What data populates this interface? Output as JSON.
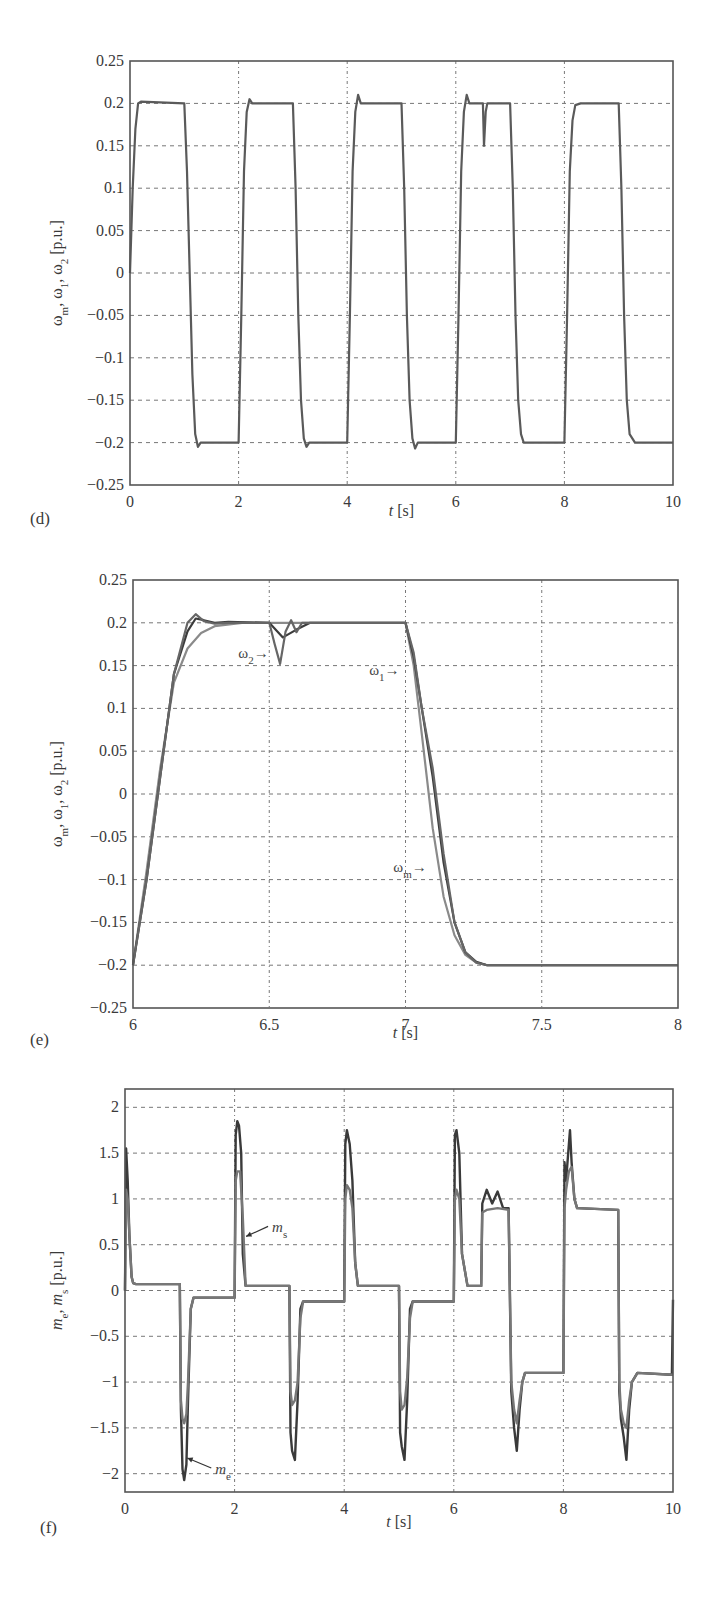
{
  "chart_data": [
    {
      "id": "d",
      "type": "line",
      "panel_label": "(d)",
      "title": "",
      "xlabel": "t [s]",
      "ylabel": "ωm, ω1, ω2 [p.u.]",
      "xlim": [
        0,
        10
      ],
      "ylim": [
        -0.25,
        0.25
      ],
      "xticks": [
        0,
        2,
        4,
        6,
        8,
        10
      ],
      "xtick_labels": [
        "0",
        "2",
        "4",
        "6",
        "8",
        "10"
      ],
      "yticks": [
        0.25,
        0.2,
        0.15,
        0.1,
        0.05,
        0,
        -0.05,
        -0.1,
        -0.15,
        -0.2,
        -0.25
      ],
      "ytick_labels": [
        "0.25",
        "0.2",
        "0.15",
        "0.1",
        "0.05",
        "0",
        "−0.05",
        "−0.1",
        "−0.15",
        "−0.2",
        "−0.25"
      ],
      "grid": true,
      "series": [
        {
          "name": "ωm, ω1, ω2 (overlapping)",
          "color": "#5a5a5a",
          "x": [
            0,
            0.05,
            0.1,
            0.15,
            0.2,
            1.0,
            1.05,
            1.1,
            1.15,
            1.2,
            1.25,
            1.3,
            2.0,
            2.05,
            2.1,
            2.15,
            2.2,
            2.25,
            3.0,
            3.05,
            3.1,
            3.15,
            3.2,
            3.25,
            3.3,
            4.0,
            4.05,
            4.1,
            4.15,
            4.2,
            4.25,
            5.0,
            5.05,
            5.1,
            5.15,
            5.2,
            5.25,
            5.3,
            6.0,
            6.05,
            6.1,
            6.15,
            6.2,
            6.25,
            6.5,
            6.52,
            6.55,
            6.58,
            6.6,
            7.0,
            7.05,
            7.1,
            7.15,
            7.2,
            7.25,
            7.35,
            8.0,
            8.05,
            8.1,
            8.15,
            8.2,
            8.3,
            9.0,
            9.05,
            9.1,
            9.15,
            9.2,
            9.3,
            10.0
          ],
          "y": [
            0.0,
            0.1,
            0.17,
            0.2,
            0.202,
            0.2,
            0.12,
            0.0,
            -0.12,
            -0.19,
            -0.205,
            -0.2,
            -0.2,
            -0.05,
            0.12,
            0.19,
            0.205,
            0.2,
            0.2,
            0.1,
            -0.05,
            -0.15,
            -0.195,
            -0.205,
            -0.2,
            -0.2,
            -0.05,
            0.12,
            0.19,
            0.21,
            0.2,
            0.2,
            0.1,
            -0.05,
            -0.15,
            -0.195,
            -0.207,
            -0.2,
            -0.2,
            -0.05,
            0.12,
            0.19,
            0.21,
            0.2,
            0.2,
            0.15,
            0.19,
            0.2,
            0.2,
            0.2,
            0.1,
            -0.05,
            -0.15,
            -0.19,
            -0.2,
            -0.2,
            -0.2,
            -0.05,
            0.12,
            0.18,
            0.198,
            0.2,
            0.2,
            0.1,
            -0.05,
            -0.15,
            -0.19,
            -0.2,
            -0.2
          ]
        }
      ]
    },
    {
      "id": "e",
      "type": "line",
      "panel_label": "(e)",
      "title": "",
      "xlabel": "t [s]",
      "ylabel": "ωm, ω1, ω2 [p.u.]",
      "xlim": [
        6,
        8
      ],
      "ylim": [
        -0.25,
        0.25
      ],
      "xticks": [
        6,
        6.5,
        7,
        7.5,
        8
      ],
      "xtick_labels": [
        "6",
        "6.5",
        "7",
        "7.5",
        "8"
      ],
      "yticks": [
        0.25,
        0.2,
        0.15,
        0.1,
        0.05,
        0,
        -0.05,
        -0.1,
        -0.15,
        -0.2,
        -0.25
      ],
      "ytick_labels": [
        "0.25",
        "0.2",
        "0.15",
        "0.1",
        "0.05",
        "0",
        "−0.05",
        "−0.1",
        "−0.15",
        "−0.2",
        "−0.25"
      ],
      "grid": true,
      "annotations": [
        {
          "text": "ω2→",
          "target": "ω2",
          "x": 6.52,
          "y": 0.165
        },
        {
          "text": "ω1→",
          "target": "ω1",
          "x": 7.0,
          "y": 0.145
        },
        {
          "text": "ωm→",
          "target": "ωm",
          "x": 7.1,
          "y": -0.085
        }
      ],
      "series": [
        {
          "name": "ωm",
          "color": "#8a8a8a",
          "x": [
            6.0,
            6.05,
            6.1,
            6.15,
            6.2,
            6.25,
            6.3,
            6.4,
            6.5,
            7.0,
            7.03,
            7.06,
            7.1,
            7.14,
            7.18,
            7.22,
            7.26,
            7.3,
            7.4,
            8.0
          ],
          "y": [
            -0.2,
            -0.09,
            0.03,
            0.13,
            0.17,
            0.188,
            0.196,
            0.2,
            0.2,
            0.2,
            0.15,
            0.07,
            -0.04,
            -0.12,
            -0.165,
            -0.188,
            -0.197,
            -0.2,
            -0.2,
            -0.2
          ]
        },
        {
          "name": "ω1",
          "color": "#3c3c3c",
          "x": [
            6.0,
            6.05,
            6.1,
            6.15,
            6.2,
            6.23,
            6.26,
            6.3,
            6.35,
            6.5,
            6.55,
            6.6,
            6.65,
            7.0,
            7.03,
            7.06,
            7.1,
            7.14,
            7.18,
            7.22,
            7.26,
            7.3,
            7.4,
            8.0
          ],
          "y": [
            -0.2,
            -0.1,
            0.02,
            0.14,
            0.19,
            0.205,
            0.203,
            0.2,
            0.201,
            0.2,
            0.183,
            0.192,
            0.2,
            0.2,
            0.16,
            0.1,
            0.02,
            -0.08,
            -0.15,
            -0.185,
            -0.196,
            -0.2,
            -0.2,
            -0.2
          ]
        },
        {
          "name": "ω2",
          "color": "#666666",
          "x": [
            6.0,
            6.05,
            6.1,
            6.15,
            6.2,
            6.23,
            6.26,
            6.3,
            6.35,
            6.5,
            6.52,
            6.54,
            6.56,
            6.58,
            6.6,
            6.62,
            6.65,
            7.0,
            7.03,
            7.06,
            7.1,
            7.14,
            7.18,
            7.22,
            7.26,
            7.3,
            7.4,
            8.0
          ],
          "y": [
            -0.2,
            -0.1,
            0.02,
            0.14,
            0.2,
            0.21,
            0.202,
            0.199,
            0.2,
            0.2,
            0.175,
            0.152,
            0.19,
            0.203,
            0.189,
            0.2,
            0.2,
            0.2,
            0.165,
            0.1,
            0.03,
            -0.07,
            -0.15,
            -0.185,
            -0.197,
            -0.2,
            -0.2,
            -0.2
          ]
        }
      ]
    },
    {
      "id": "f",
      "type": "line",
      "panel_label": "(f)",
      "title": "",
      "xlabel": "t [s]",
      "ylabel": "me, ms [p.u.]",
      "xlim": [
        0,
        10
      ],
      "ylim": [
        -2.2,
        2.2
      ],
      "xticks": [
        0,
        2,
        4,
        6,
        8,
        10
      ],
      "xtick_labels": [
        "0",
        "2",
        "4",
        "6",
        "8",
        "10"
      ],
      "yticks": [
        2,
        1.5,
        1,
        0.5,
        0,
        -0.5,
        -1,
        -1.5,
        -2
      ],
      "ytick_labels": [
        "2",
        "1.5",
        "1",
        "0.5",
        "0",
        "−0.5",
        "−1",
        "−1.5",
        "−2"
      ],
      "grid": true,
      "annotations": [
        {
          "text": "ms",
          "target": "ms",
          "x": 2.1,
          "y": 0.7
        },
        {
          "text": "me",
          "target": "me",
          "x": 1.1,
          "y": -1.85
        }
      ],
      "series": [
        {
          "name": "me",
          "color": "#3a3a3a",
          "x": [
            0,
            0.02,
            0.05,
            0.08,
            0.12,
            0.15,
            0.2,
            1.0,
            1.02,
            1.05,
            1.08,
            1.12,
            1.15,
            1.2,
            1.25,
            2.0,
            2.02,
            2.05,
            2.08,
            2.12,
            2.15,
            2.2,
            3.0,
            3.02,
            3.05,
            3.1,
            3.15,
            3.2,
            3.25,
            4.0,
            4.02,
            4.05,
            4.1,
            4.15,
            4.2,
            4.25,
            5.0,
            5.02,
            5.05,
            5.1,
            5.15,
            5.2,
            5.25,
            6.0,
            6.02,
            6.05,
            6.1,
            6.15,
            6.25,
            6.5,
            6.52,
            6.6,
            6.7,
            6.8,
            6.9,
            7.0,
            7.05,
            7.1,
            7.15,
            7.2,
            7.25,
            7.3,
            7.4,
            8.0,
            8.02,
            8.05,
            8.1,
            8.12,
            8.15,
            8.2,
            8.25,
            9.0,
            9.02,
            9.05,
            9.1,
            9.15,
            9.2,
            9.25,
            9.35,
            9.98,
            10.0
          ],
          "y": [
            0,
            1.55,
            1.2,
            0.6,
            0.15,
            0.08,
            0.07,
            0.07,
            -1.3,
            -1.95,
            -2.07,
            -1.9,
            -1.2,
            -0.2,
            -0.08,
            -0.08,
            1.7,
            1.85,
            1.8,
            1.5,
            0.4,
            0.05,
            0.05,
            -1.55,
            -1.75,
            -1.85,
            -1.2,
            -0.2,
            -0.12,
            -0.12,
            1.6,
            1.75,
            1.6,
            1.2,
            0.3,
            0.05,
            0.05,
            -1.55,
            -1.7,
            -1.85,
            -1.2,
            -0.2,
            -0.12,
            -0.12,
            1.7,
            1.75,
            1.5,
            0.4,
            0.05,
            0.05,
            0.95,
            1.1,
            0.95,
            1.08,
            0.9,
            0.9,
            -1.1,
            -1.5,
            -1.75,
            -1.3,
            -1.0,
            -0.9,
            -0.9,
            -0.9,
            1.4,
            1.2,
            1.6,
            1.75,
            1.4,
            1.0,
            0.9,
            0.88,
            -1.1,
            -1.4,
            -1.6,
            -1.85,
            -1.3,
            -1.0,
            -0.9,
            -0.92,
            -0.1
          ]
        },
        {
          "name": "ms",
          "color": "#777777",
          "x": [
            0,
            0.02,
            0.05,
            0.08,
            0.12,
            0.15,
            0.2,
            1.0,
            1.02,
            1.05,
            1.08,
            1.12,
            1.15,
            1.2,
            1.25,
            2.0,
            2.02,
            2.05,
            2.1,
            2.15,
            2.2,
            3.0,
            3.02,
            3.05,
            3.1,
            3.15,
            3.2,
            3.25,
            4.0,
            4.02,
            4.05,
            4.1,
            4.15,
            4.2,
            4.25,
            5.0,
            5.02,
            5.05,
            5.1,
            5.15,
            5.2,
            5.25,
            6.0,
            6.02,
            6.05,
            6.1,
            6.15,
            6.25,
            6.5,
            6.52,
            6.6,
            6.8,
            7.0,
            7.05,
            7.1,
            7.15,
            7.2,
            7.25,
            7.3,
            7.4,
            8.0,
            8.02,
            8.05,
            8.1,
            8.15,
            8.2,
            8.25,
            9.0,
            9.02,
            9.05,
            9.1,
            9.15,
            9.2,
            9.25,
            9.35,
            10.0
          ],
          "y": [
            0,
            1.1,
            1.0,
            0.6,
            0.15,
            0.08,
            0.07,
            0.07,
            -1.2,
            -1.4,
            -1.45,
            -1.35,
            -1.0,
            -0.2,
            -0.08,
            -0.08,
            1.2,
            1.3,
            1.3,
            0.8,
            0.05,
            0.05,
            -1.1,
            -1.25,
            -1.2,
            -1.0,
            -0.3,
            -0.12,
            -0.12,
            1.0,
            1.15,
            1.1,
            0.9,
            0.3,
            0.05,
            0.05,
            -1.1,
            -1.3,
            -1.25,
            -0.95,
            -0.3,
            -0.12,
            -0.12,
            1.0,
            1.1,
            1.0,
            0.4,
            0.05,
            0.05,
            0.85,
            0.88,
            0.9,
            0.88,
            -1.0,
            -1.3,
            -1.45,
            -1.2,
            -1.0,
            -0.9,
            -0.9,
            -0.9,
            0.9,
            1.1,
            1.3,
            1.35,
            1.0,
            0.9,
            0.88,
            -1.0,
            -1.3,
            -1.45,
            -1.5,
            -1.2,
            -1.0,
            -0.9,
            -0.92
          ]
        }
      ]
    }
  ]
}
